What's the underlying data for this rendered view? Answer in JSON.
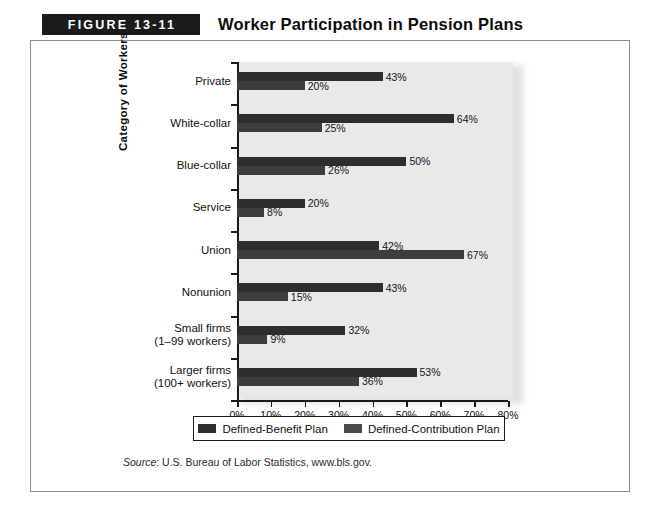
{
  "figure": {
    "tag": "FIGURE 13-11",
    "title": "Worker Participation in Pension Plans",
    "source_prefix": "Source",
    "source_text": ": U.S. Bureau of Labor Statistics, www.bls.gov."
  },
  "chart_data": {
    "type": "bar",
    "orientation": "horizontal",
    "title": "Worker Participation in Pension Plans",
    "xlabel": "Percentages",
    "ylabel": "Category of Workers",
    "xlim": [
      0,
      80
    ],
    "xticks": [
      "0%",
      "10%",
      "20%",
      "30%",
      "40%",
      "50%",
      "60%",
      "70%",
      "80%"
    ],
    "xtick_values": [
      0,
      10,
      20,
      30,
      40,
      50,
      60,
      70,
      80
    ],
    "grid": false,
    "legend_position": "bottom",
    "categories": [
      "Private",
      "White-collar",
      "Blue-collar",
      "Service",
      "Union",
      "Nonunion",
      "Small firms\n(1–99 workers)",
      "Larger firms\n(100+ workers)"
    ],
    "category_lines": [
      [
        "Private"
      ],
      [
        "White-collar"
      ],
      [
        "Blue-collar"
      ],
      [
        "Service"
      ],
      [
        "Union"
      ],
      [
        "Nonunion"
      ],
      [
        "Small firms",
        "(1–99 workers)"
      ],
      [
        "Larger firms",
        "(100+ workers)"
      ]
    ],
    "series": [
      {
        "name": "Defined-Benefit Plan",
        "color": "#2e2e2e",
        "values": [
          43,
          64,
          50,
          20,
          42,
          43,
          32,
          53
        ],
        "labels": [
          "43%",
          "64%",
          "50%",
          "20%",
          "42%",
          "43%",
          "32%",
          "53%"
        ]
      },
      {
        "name": "Defined-Contribution Plan",
        "color": "#4a4a4a",
        "values": [
          20,
          25,
          26,
          8,
          67,
          15,
          9,
          36
        ],
        "labels": [
          "20%",
          "25%",
          "26%",
          "8%",
          "67%",
          "15%",
          "9%",
          "36%"
        ]
      }
    ]
  }
}
